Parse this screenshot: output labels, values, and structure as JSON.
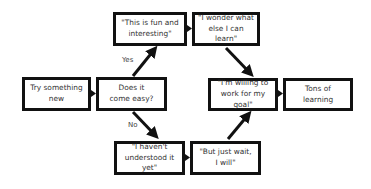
{
  "nodes": {
    "start": {
      "text": "Try something\nnew"
    },
    "decision": {
      "text": "Does it\ncome easy?"
    },
    "yes_node": {
      "text": "\"This is fun and\ninteresting\""
    },
    "wonder": {
      "text": "\"I wonder what\nelse I can learn\""
    },
    "no_node": {
      "text": "\"I haven't\nunderstood it yet\""
    },
    "wait": {
      "text": "\"But just wait,\nI will\""
    },
    "willing": {
      "text": "\"I'm willing to\nwork for my goal\""
    },
    "result": {
      "text": "Tons of learning"
    }
  },
  "edges": {
    "yes_label": "Yes",
    "no_label": "No"
  },
  "colors": {
    "stroke": "#111111",
    "text": "#333333",
    "background": "#ffffff"
  }
}
